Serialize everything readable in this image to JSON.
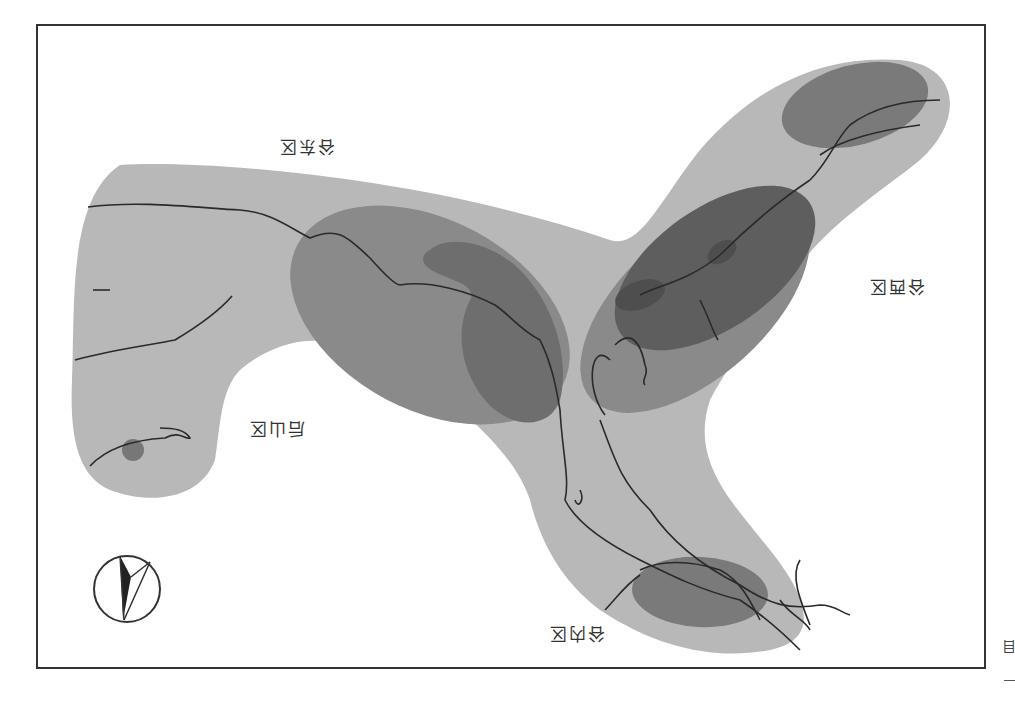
{
  "map": {
    "orientation": "rotated-180",
    "colors": {
      "background": "#ffffff",
      "frame": "#333333",
      "light_zone": "#b8b8b8",
      "medium_zone": "#8a8a8a",
      "dark_zone": "#6e6e6e",
      "darkest_zone": "#5e5e5e",
      "river": "#2a2a2a"
    },
    "labels": {
      "east_valley": "谷东区",
      "west_valley": "谷西区",
      "back_mountain": "后山区",
      "inner_valley": "谷内区"
    },
    "compass": {
      "icon": "north-arrow-icon"
    },
    "edge_text": "目"
  }
}
